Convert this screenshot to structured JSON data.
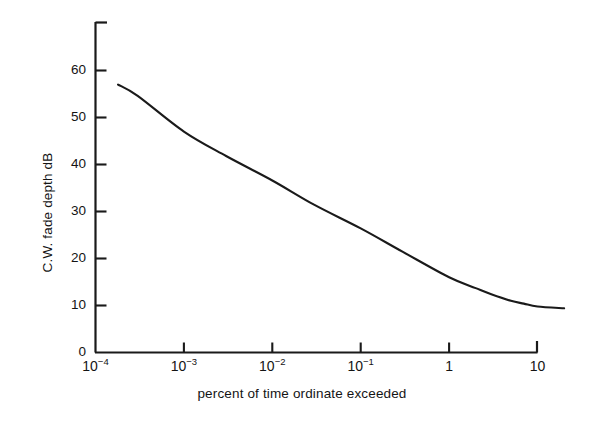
{
  "chart_data": {
    "type": "line",
    "title": "",
    "subtitle": "",
    "xlabel": "percent of time ordinate exceeded",
    "ylabel": "C.W. fade depth dB",
    "xscale": "log",
    "yscale": "linear",
    "xtick_labels": [
      "10-4",
      "10-3",
      "10-2",
      "10-1",
      "1",
      "10"
    ],
    "xtick_mantissa": [
      "10",
      "10",
      "10",
      "10",
      "1",
      "10"
    ],
    "xtick_exponent": [
      "−4",
      "−3",
      "−2",
      "−1",
      "",
      ""
    ],
    "xtick_values": [
      0.0001,
      0.001,
      0.01,
      0.1,
      1,
      10
    ],
    "ytick_labels": [
      "0",
      "10",
      "20",
      "30",
      "40",
      "50",
      "60"
    ],
    "ytick_values": [
      0,
      10,
      20,
      30,
      40,
      50,
      60
    ],
    "xlim": [
      0.0001,
      10
    ],
    "ylim": [
      0,
      70
    ],
    "grid": false,
    "legend": false,
    "legend_position": "none",
    "series": [
      {
        "name": "C.W. fade depth",
        "color": "#1a1a1a",
        "x": [
          0.00018,
          0.0003,
          0.001,
          0.003,
          0.01,
          0.03,
          0.1,
          0.3,
          1.0,
          2.0,
          3.0,
          5.0,
          7.0,
          10.0,
          20.0
        ],
        "y": [
          57.0,
          54.6,
          47.0,
          41.8,
          36.6,
          31.4,
          26.4,
          21.4,
          16.0,
          13.7,
          12.4,
          11.0,
          10.4,
          9.8,
          9.4
        ]
      }
    ],
    "annotations": []
  },
  "figure": {
    "background_color": "#ffffff",
    "axis_color": "#1a1a1a",
    "line_color": "#1a1a1a"
  }
}
